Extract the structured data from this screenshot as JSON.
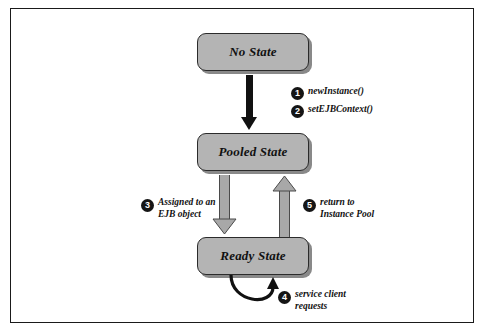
{
  "diagram": {
    "frame": {
      "border_color": "#1a1a1a"
    },
    "states": [
      {
        "id": "no-state",
        "label": "No State"
      },
      {
        "id": "pooled-state",
        "label": "Pooled State"
      },
      {
        "id": "ready-state",
        "label": "Ready State"
      }
    ],
    "transitions": [
      {
        "number": "1",
        "label": "newInstance()",
        "from": "no-state",
        "to": "pooled-state",
        "arrow_style": "solid-black"
      },
      {
        "number": "2",
        "label": "setEJBContext()",
        "from": "no-state",
        "to": "pooled-state",
        "arrow_style": "solid-black"
      },
      {
        "number": "3",
        "label": "Assigned to an\nEJB object",
        "from": "pooled-state",
        "to": "ready-state",
        "arrow_style": "hollow-grey"
      },
      {
        "number": "5",
        "label": "return to\nInstance Pool",
        "from": "ready-state",
        "to": "pooled-state",
        "arrow_style": "hollow-grey"
      },
      {
        "number": "4",
        "label": "service client\nrequests",
        "from": "ready-state",
        "to": "ready-state",
        "arrow_style": "self-loop-black"
      }
    ],
    "colors": {
      "box_fill": "#b4b4b4",
      "box_border": "#2b2b2b",
      "arrow_black": "#111111",
      "arrow_grey_fill": "#a8a8a8",
      "arrow_grey_outline": "#4a4a4a",
      "text": "#111111",
      "bullet_fill": "#151515",
      "bullet_text": "#ffffff"
    }
  }
}
